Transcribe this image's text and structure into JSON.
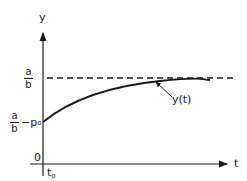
{
  "diagram": {
    "y_axis_label": "y",
    "x_axis_label": "t",
    "origin_label": "0",
    "t0_label": {
      "main": "t",
      "sub": "o"
    },
    "asymptote_label": {
      "num": "a",
      "den": "b"
    },
    "initial_label": {
      "num": "a",
      "den": "b",
      "suffix": "−p",
      "sub": "o"
    },
    "curve_label": "y(t)",
    "colors": {
      "ink": "#1a1a1a",
      "background": "#ffffff"
    }
  }
}
